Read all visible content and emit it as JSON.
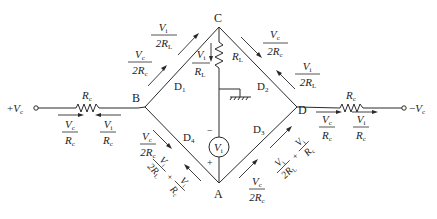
{
  "diagram": {
    "nodes": {
      "A": "A",
      "B": "B",
      "C": "C",
      "D": "D"
    },
    "terminals": {
      "left": {
        "sign": "+",
        "v": "V",
        "sub": "c"
      },
      "right": {
        "sign": "−",
        "v": "V",
        "sub": "c"
      }
    },
    "diodes": {
      "d1": {
        "letter": "D",
        "sub": "1"
      },
      "d2": {
        "letter": "D",
        "sub": "2"
      },
      "d3": {
        "letter": "D",
        "sub": "3"
      },
      "d4": {
        "letter": "D",
        "sub": "4"
      }
    },
    "resistors": {
      "rc_left": {
        "letter": "R",
        "sub": "c"
      },
      "rc_right": {
        "letter": "R",
        "sub": "c"
      },
      "rl": {
        "letter": "R",
        "sub": "L"
      }
    },
    "source": {
      "letter": "V",
      "sub": "i",
      "minus": "−",
      "plus": "+"
    },
    "currents": {
      "bc_vi": {
        "num": "V",
        "num_sub": "i",
        "den": "2R",
        "den_sub": "L"
      },
      "bc_vc": {
        "num": "V",
        "num_sub": "c",
        "den": "2R",
        "den_sub": "c"
      },
      "cd_vc": {
        "num": "V",
        "num_sub": "c",
        "den": "2R",
        "den_sub": "c"
      },
      "cd_vi": {
        "num": "V",
        "num_sub": "i",
        "den": "2R",
        "den_sub": "L"
      },
      "rl_vi": {
        "num": "V",
        "num_sub": "i",
        "den": "R",
        "den_sub": "L"
      },
      "left_vc": {
        "num": "V",
        "num_sub": "c",
        "den": "R",
        "den_sub": "c"
      },
      "left_vi": {
        "num": "V",
        "num_sub": "i",
        "den": "R",
        "den_sub": "c"
      },
      "right_vc": {
        "num": "V",
        "num_sub": "c",
        "den": "R",
        "den_sub": "c"
      },
      "right_vi": {
        "num": "V",
        "num_sub": "i",
        "den": "R",
        "den_sub": "c"
      },
      "ba_vc": {
        "num": "V",
        "num_sub": "c",
        "den": "2R",
        "den_sub": "c"
      },
      "ba_sum": {
        "a_num": "V",
        "a_num_sub": "i",
        "a_den": "2R",
        "a_den_sub": "L",
        "plus": "+",
        "b_num": "V",
        "b_num_sub": "i",
        "b_den": "R",
        "b_den_sub": "c"
      },
      "ad_vc": {
        "num": "V",
        "num_sub": "c",
        "den": "2R",
        "den_sub": "c"
      },
      "ad_sum": {
        "a_num": "V",
        "a_num_sub": "i",
        "a_den": "2R",
        "a_den_sub": "L",
        "plus": "+",
        "b_num": "V",
        "b_num_sub": "i",
        "b_den": "R",
        "b_den_sub": "c"
      }
    }
  }
}
